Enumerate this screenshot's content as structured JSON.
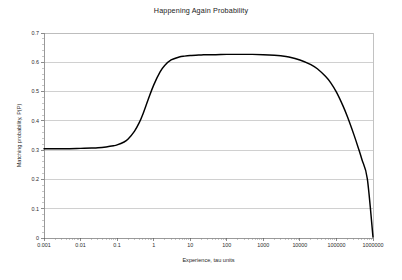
{
  "chart_data": {
    "type": "line",
    "title": "Happening Again Probability",
    "xlabel": "Experience, tau units",
    "ylabel": "Matching probability, P(P)",
    "xscale": "log",
    "yscale": "linear",
    "xlim": [
      0.001,
      1000000
    ],
    "ylim": [
      0,
      0.7
    ],
    "grid": true,
    "grid_axis": "y",
    "legend": false,
    "legend_position": "none",
    "xticks": [
      0.001,
      0.01,
      0.1,
      1,
      10,
      100,
      1000,
      10000,
      100000,
      1000000
    ],
    "xticklabels": [
      "0.001",
      "0.01",
      "0.1",
      "1",
      "10",
      "100",
      "1000",
      "10000",
      "100000",
      "1000000"
    ],
    "yticks": [
      0,
      0.1,
      0.2,
      0.3,
      0.4,
      0.5,
      0.6,
      0.7
    ],
    "yticklabels": [
      "0",
      "0.1",
      "0.2",
      "0.3",
      "0.4",
      "0.5",
      "0.6",
      "0.7"
    ],
    "series": [
      {
        "name": "Matching probability",
        "color": "#000000",
        "x": [
          0.001,
          0.002,
          0.005,
          0.01,
          0.02,
          0.03,
          0.05,
          0.08,
          0.1,
          0.15,
          0.2,
          0.3,
          0.4,
          0.5,
          0.7,
          1,
          1.5,
          2,
          3,
          5,
          7,
          10,
          20,
          30,
          50,
          100,
          200,
          300,
          500,
          1000,
          2000,
          3000,
          5000,
          10000,
          20000,
          30000,
          50000,
          70000,
          100000,
          150000,
          200000,
          300000,
          400000,
          500000,
          700000,
          1000000
        ],
        "y": [
          0.305,
          0.305,
          0.305,
          0.306,
          0.307,
          0.308,
          0.311,
          0.315,
          0.318,
          0.327,
          0.338,
          0.365,
          0.393,
          0.421,
          0.471,
          0.522,
          0.567,
          0.589,
          0.608,
          0.618,
          0.621,
          0.623,
          0.625,
          0.626,
          0.626,
          0.627,
          0.627,
          0.627,
          0.627,
          0.626,
          0.624,
          0.622,
          0.618,
          0.608,
          0.592,
          0.578,
          0.552,
          0.53,
          0.498,
          0.452,
          0.414,
          0.353,
          0.306,
          0.267,
          0.202,
          0.003
        ]
      }
    ]
  },
  "axis": {
    "y_label_text": "Matching probability, P(P)",
    "x_label_text": "Experience, tau units"
  }
}
